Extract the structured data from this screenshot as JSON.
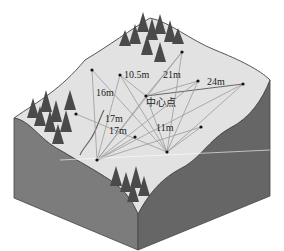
{
  "diagram": {
    "type": "isometric-terrain-block",
    "colors": {
      "surface": "#e2e2e2",
      "side_left": "#7a7a7a",
      "side_right": "#6a6a6a",
      "tree": "#4a4a4a",
      "line": "#9a9a9a",
      "point": "#111111"
    },
    "center_label": "中心点",
    "distance_labels": [
      {
        "text": "10.5m",
        "x": 124,
        "y": 78
      },
      {
        "text": "21m",
        "x": 163,
        "y": 78
      },
      {
        "text": "24m",
        "x": 207,
        "y": 85
      },
      {
        "text": "16m",
        "x": 96,
        "y": 96
      },
      {
        "text": "17m",
        "x": 105,
        "y": 122
      },
      {
        "text": "17m",
        "x": 109,
        "y": 134
      },
      {
        "text": "11m",
        "x": 156,
        "y": 131
      }
    ],
    "points": [
      {
        "id": "center",
        "x": 146,
        "y": 96
      },
      {
        "id": "p1",
        "x": 92,
        "y": 70
      },
      {
        "id": "p2",
        "x": 120,
        "y": 75
      },
      {
        "id": "p3",
        "x": 182,
        "y": 52
      },
      {
        "id": "p4",
        "x": 198,
        "y": 81
      },
      {
        "id": "p5",
        "x": 243,
        "y": 84
      },
      {
        "id": "p6",
        "x": 76,
        "y": 114
      },
      {
        "id": "p7",
        "x": 135,
        "y": 137
      },
      {
        "id": "p8",
        "x": 201,
        "y": 127
      },
      {
        "id": "p9",
        "x": 97,
        "y": 160
      },
      {
        "id": "p10",
        "x": 167,
        "y": 152
      }
    ]
  }
}
